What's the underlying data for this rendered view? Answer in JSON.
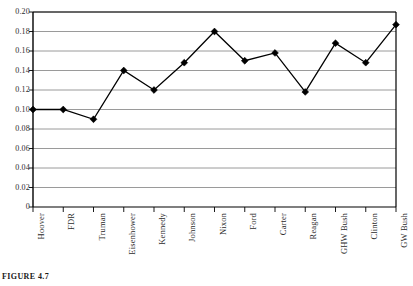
{
  "caption": "FIGURE 4.7",
  "chart_data": {
    "type": "line",
    "title": "",
    "xlabel": "",
    "ylabel": "",
    "ylim": [
      0,
      0.2
    ],
    "ytick_step": 0.02,
    "grid": true,
    "legend": false,
    "marker": "diamond",
    "marker_color": "#000000",
    "line_color": "#000000",
    "grid_color": "#808080",
    "axis_color": "#000000",
    "categories": [
      "Hoover",
      "FDR",
      "Truman",
      "Eisenhower",
      "Kennedy",
      "Johnson",
      "Nixon",
      "Ford",
      "Carter",
      "Reagan",
      "GHW Bush",
      "Clinton",
      "GW Bush"
    ],
    "values": [
      0.1,
      0.1,
      0.09,
      0.14,
      0.12,
      0.148,
      0.18,
      0.15,
      0.158,
      0.118,
      0.168,
      0.148,
      0.187
    ],
    "ytick_labels": [
      "0.20",
      "0.18",
      "0.16",
      "0.14",
      "0.12",
      "0.10",
      "0.08",
      "0.06",
      "0.04",
      "0.02",
      "0"
    ],
    "ytick_values": [
      0.2,
      0.18,
      0.16,
      0.14,
      0.12,
      0.1,
      0.08,
      0.06,
      0.04,
      0.02,
      0
    ]
  }
}
